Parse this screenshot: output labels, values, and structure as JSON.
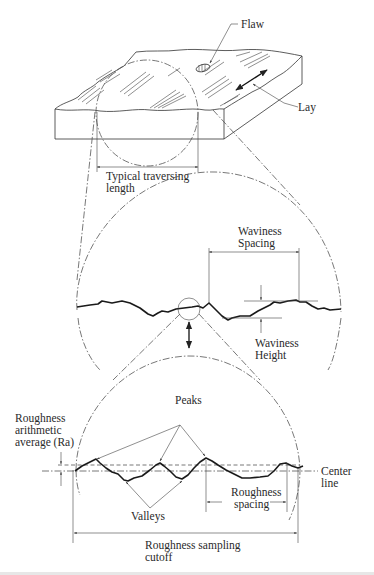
{
  "figure": {
    "top_block": {
      "labels": {
        "flaw": "Flaw",
        "lay": "Lay",
        "traverse_line1": "Typical traversing",
        "traverse_line2": "length"
      }
    },
    "waviness_view": {
      "labels": {
        "spacing_line1": "Waviness",
        "spacing_line2": "Spacing",
        "height_line1": "Waviness",
        "height_line2": "Height"
      }
    },
    "roughness_view": {
      "labels": {
        "peaks": "Peaks",
        "valleys": "Valleys",
        "ra_line1": "Roughness",
        "ra_line2": "arithmetic",
        "ra_line3": "average (Ra)",
        "center_line1": "Center",
        "center_line2": "line",
        "spacing_line1": "Roughness",
        "spacing_line2": "spacing",
        "cutoff_line1": "Roughness sampling",
        "cutoff_line2": "cutoff"
      }
    },
    "caption_partial": "(caption text cut off at bottom edge)"
  }
}
